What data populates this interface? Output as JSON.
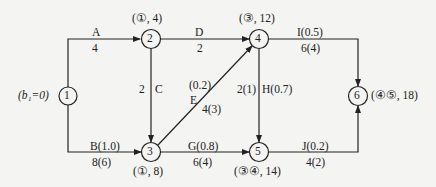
{
  "diagram": {
    "type": "activity-on-arrow network",
    "nodes": [
      {
        "id": "1",
        "label": "1",
        "annotation": "(b₁=0)"
      },
      {
        "id": "2",
        "label": "2",
        "annotation": "(①, 4)"
      },
      {
        "id": "3",
        "label": "3",
        "annotation": "(①, 8)"
      },
      {
        "id": "4",
        "label": "4",
        "annotation": "(③, 12)"
      },
      {
        "id": "5",
        "label": "5",
        "annotation": "(③④, 14)"
      },
      {
        "id": "6",
        "label": "6",
        "annotation": "(④⑤, 18)"
      }
    ],
    "edges": [
      {
        "from": "1",
        "to": "2",
        "top": "A",
        "bottom": "4"
      },
      {
        "from": "1",
        "to": "3",
        "top": "B(1.0)",
        "bottom": "8(6)"
      },
      {
        "from": "2",
        "to": "3",
        "left": "2",
        "right": "C"
      },
      {
        "from": "2",
        "to": "4",
        "top": "D",
        "bottom": "2"
      },
      {
        "from": "3",
        "to": "4",
        "cost": "(0.2)",
        "name": "E",
        "duration": "4(3)"
      },
      {
        "from": "3",
        "to": "5",
        "top": "G(0.8)",
        "bottom": "6(4)"
      },
      {
        "from": "4",
        "to": "5",
        "left": "2(1)",
        "right": "H(0.7)"
      },
      {
        "from": "4",
        "to": "6",
        "top": "I(0.5)",
        "bottom": "6(4)"
      },
      {
        "from": "5",
        "to": "6",
        "top": "J(0.2)",
        "bottom": "4(2)"
      }
    ]
  }
}
